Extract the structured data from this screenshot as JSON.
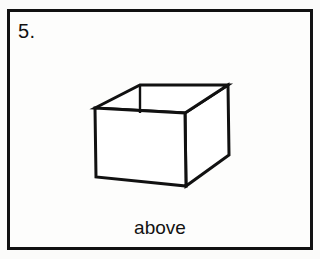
{
  "item": {
    "number_label": "5.",
    "caption": "above",
    "frame": {
      "border_color": "#111111",
      "border_width_px": 3,
      "background_color": "#fdfdfc",
      "x": 7,
      "y": 9,
      "width": 306,
      "height": 241
    }
  },
  "figure": {
    "name": "open-top-box",
    "stroke_color": "#111111",
    "fill_color": "#ffffff",
    "stroke_width_px": 3,
    "vertices": {
      "front_top_left": [
        95,
        108
      ],
      "front_top_right": [
        185,
        113
      ],
      "front_bottom_right": [
        186,
        186
      ],
      "front_bottom_left": [
        96,
        177
      ],
      "back_top_left": [
        140,
        85
      ],
      "back_top_right": [
        228,
        85
      ],
      "right_bottom_back": [
        229,
        155
      ]
    },
    "inner_edge": {
      "from": [
        140,
        85
      ],
      "to": [
        140,
        113
      ]
    }
  },
  "colors": {
    "page_background": "#ffffff",
    "ink": "#111111",
    "paper": "#fdfdfc"
  }
}
